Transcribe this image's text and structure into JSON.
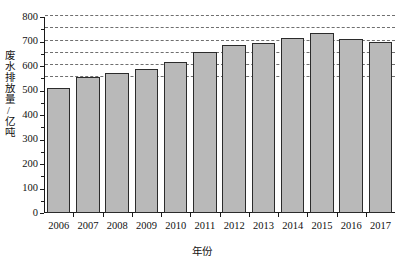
{
  "chart_data": {
    "type": "bar",
    "title": "",
    "xlabel": "年份",
    "ylabel": "废水排放量/亿吨",
    "categories": [
      "2006",
      "2007",
      "2008",
      "2009",
      "2010",
      "2011",
      "2012",
      "2013",
      "2014",
      "2015",
      "2016",
      "2017"
    ],
    "values": [
      512,
      557,
      572,
      589,
      617,
      659,
      685,
      695,
      716,
      735,
      711,
      699
    ],
    "series": [
      {
        "name": "废水排放量",
        "values": [
          512,
          557,
          572,
          589,
          617,
          659,
          685,
          695,
          716,
          735,
          711,
          699
        ]
      }
    ],
    "ylim": [
      0,
      800
    ],
    "ytick_values": [
      0,
      100,
      200,
      300,
      400,
      500,
      600,
      700,
      800
    ],
    "ytick_labels": [
      "0",
      "100",
      "200",
      "300",
      "400",
      "500",
      "600",
      "700",
      "800"
    ],
    "gridlines": [
      550,
      600,
      650,
      700,
      750,
      800
    ],
    "grid": true,
    "grid_style": "dashed",
    "legend": "none",
    "bar_color": "#b9b9b9",
    "bar_edge_color": "#2b2b2b",
    "axis_color": "#1a1a1a",
    "background": "#ffffff"
  }
}
